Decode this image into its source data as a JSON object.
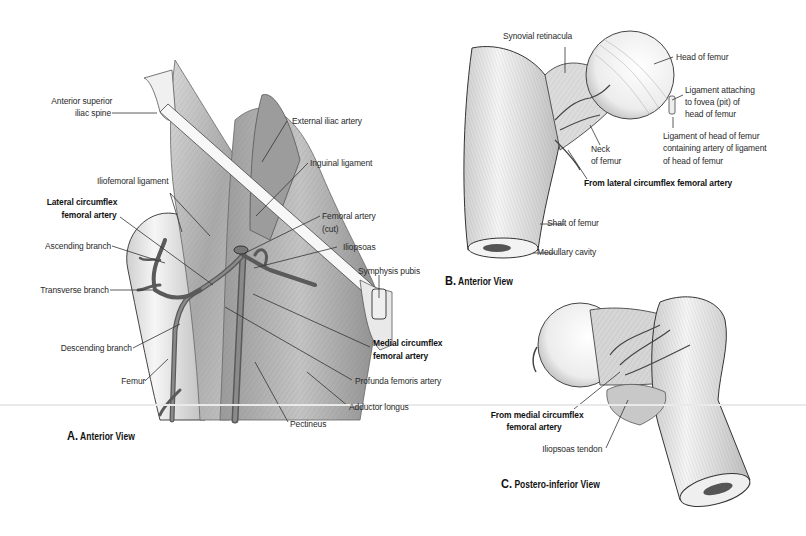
{
  "figure": {
    "panels": [
      {
        "id": "A",
        "caption_letter": "A.",
        "caption_text": "Anterior View",
        "labels": {
          "asis_1": "Anterior superior",
          "asis_2": "iliac spine",
          "external_iliac": "External iliac artery",
          "inguinal": "Inguinal ligament",
          "iliofemoral": "Iliofemoral ligament",
          "lateral_cfa_1": "Lateral circumflex",
          "lateral_cfa_2": "femoral artery",
          "femoral_artery_1": "Femoral artery",
          "femoral_artery_2": "(cut)",
          "iliopsoas": "Iliopsoas",
          "ascending": "Ascending branch",
          "symphysis": "Symphysis pubis",
          "transverse": "Transverse branch",
          "medial_cfa_1": "Medial circumflex",
          "medial_cfa_2": "femoral artery",
          "descending": "Descending branch",
          "femur": "Femur",
          "profunda": "Profunda femoris artery",
          "adductor": "Adductor longus",
          "pectineus": "Pectineus"
        }
      },
      {
        "id": "B",
        "caption_letter": "B.",
        "caption_text": "Anterior View",
        "labels": {
          "synovial": "Synovial retinacula",
          "head": "Head of femur",
          "fovea_1": "Ligament attaching",
          "fovea_2": "to fovea (pit)  of",
          "fovea_3": "head of femur",
          "lig_head_1": "Ligament of head of femur",
          "lig_head_2": "containing artery of ligament",
          "lig_head_3": "of head of femur",
          "neck_1": "Neck",
          "neck_2": "of femur",
          "from_lateral": "From lateral circumflex femoral artery",
          "shaft": "Shaft of femur",
          "medullary": "Medullary cavity"
        }
      },
      {
        "id": "C",
        "caption_letter": "C.",
        "caption_text": "Postero-inferior View",
        "labels": {
          "from_medial_1": "From medial circumflex",
          "from_medial_2": "femoral artery",
          "iliopsoas_tendon": "Iliopsoas tendon"
        }
      }
    ],
    "colors": {
      "ink": "#2a2a2a",
      "artery": "#6e6e6e",
      "muscle": "#b8b8b8",
      "bone": "#f2f2f2",
      "background": "#ffffff"
    }
  }
}
